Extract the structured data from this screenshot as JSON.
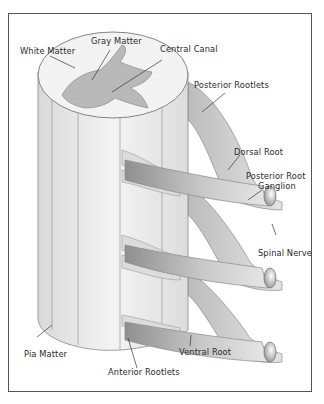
{
  "diagram": {
    "labels": {
      "white_matter": "White Matter",
      "gray_matter": "Gray Matter",
      "central_canal": "Central Canal",
      "posterior_rootlets": "Posterior Rootlets",
      "dorsal_root": "Dorsal Root",
      "posterior_root_ganglion_1": "Posterior Root",
      "posterior_root_ganglion_2": "Ganglion",
      "spinal_nerve": "Spinal Nerve",
      "pia_matter": "Pia Matter",
      "ventral_root": "Ventral Root",
      "anterior_rootlets": "Anterior Rootlets"
    },
    "colors": {
      "frame": "#555555",
      "cord_fill": "#eeeeee",
      "gray_matter": "#b9b9b9",
      "nerve_light": "#e2e2e2",
      "nerve_dark": "#9a9a9a",
      "outline": "#7a7a7a",
      "leader_line": "#333333"
    }
  }
}
